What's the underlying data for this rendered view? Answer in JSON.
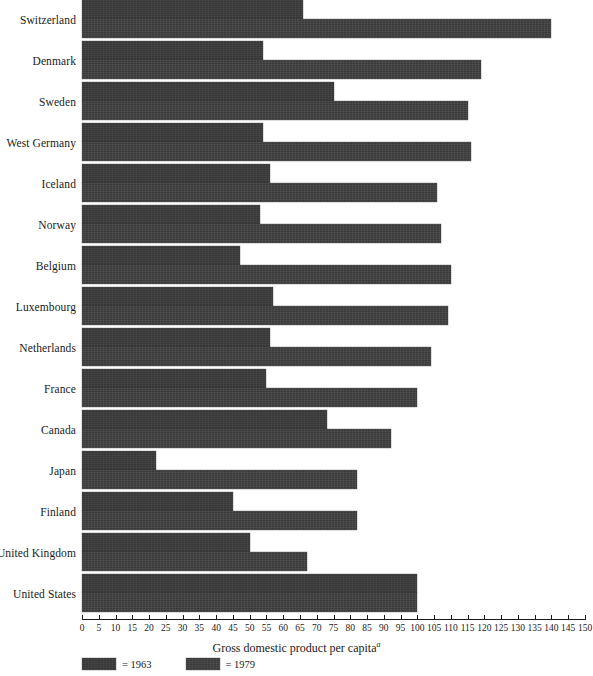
{
  "chart_data": {
    "type": "bar",
    "orientation": "horizontal",
    "title": "",
    "xlabel": "Gross domestic product per capita",
    "xlabel_superscript": "a",
    "ylabel": "",
    "xlim": [
      0,
      150
    ],
    "xtick_step": 5,
    "grid": false,
    "legend_position": "bottom-left",
    "xticks": [
      "0",
      "5",
      "10",
      "15",
      "20",
      "25",
      "30",
      "35",
      "40",
      "45",
      "50",
      "55",
      "60",
      "65",
      "70",
      "75",
      "80",
      "85",
      "90",
      "95",
      "100",
      "105",
      "110",
      "115",
      "120",
      "125",
      "130",
      "135",
      "140",
      "145",
      "150"
    ],
    "categories": [
      "Switzerland",
      "Denmark",
      "Sweden",
      "West Germany",
      "Iceland",
      "Norway",
      "Belgium",
      "Luxembourg",
      "Netherlands",
      "France",
      "Canada",
      "Japan",
      "Finland",
      "United Kingdom",
      "United States"
    ],
    "series": [
      {
        "name": "1963",
        "legend_label": "= 1963",
        "color": "#3a3a3a",
        "values": [
          66,
          54,
          75,
          54,
          56,
          53,
          47,
          57,
          56,
          55,
          73,
          22,
          45,
          50,
          100
        ]
      },
      {
        "name": "1979",
        "legend_label": "= 1979",
        "color": "#3e3e3e",
        "values": [
          140,
          119,
          115,
          116,
          106,
          107,
          110,
          109,
          104,
          100,
          92,
          82,
          82,
          67,
          100
        ]
      }
    ]
  }
}
